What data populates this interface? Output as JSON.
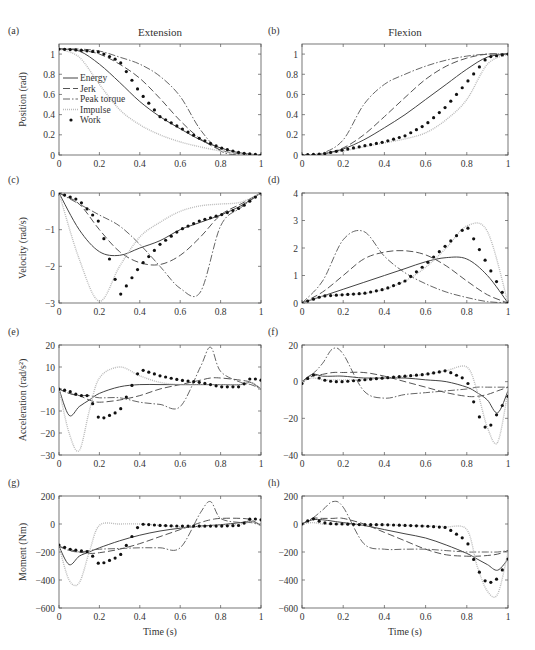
{
  "figure": {
    "column_titles": [
      "Extension",
      "Flexion"
    ],
    "xlabel": "Time (s)",
    "legend": {
      "panel": "a",
      "entries": [
        {
          "name": "Energy",
          "style": "solid"
        },
        {
          "name": "Jerk",
          "style": "dashed"
        },
        {
          "name": "Peak torque",
          "style": "dashdot"
        },
        {
          "name": "Impulse",
          "style": "dotted-light"
        },
        {
          "name": "Work",
          "style": "markers"
        }
      ]
    }
  },
  "chart_data": [
    {
      "panel": "(a)",
      "type": "line",
      "title": "Extension",
      "xlabel": "",
      "ylabel": "Position (rad)",
      "xlim": [
        0,
        1
      ],
      "ylim": [
        0,
        1.1
      ],
      "xticks": [
        "0",
        "0.2",
        "0.4",
        "0.6",
        "0.8",
        "1"
      ],
      "yticks": [
        "0",
        "0.2",
        "0.4",
        "0.6",
        "0.8",
        "1"
      ],
      "x": [
        0,
        0.1,
        0.2,
        0.3,
        0.4,
        0.5,
        0.6,
        0.7,
        0.8,
        0.9,
        1.0
      ],
      "series": [
        {
          "name": "Energy",
          "values": [
            1.05,
            1.03,
            0.9,
            0.72,
            0.53,
            0.38,
            0.26,
            0.15,
            0.07,
            0.02,
            0
          ]
        },
        {
          "name": "Jerk",
          "values": [
            1.05,
            1.04,
            1.0,
            0.9,
            0.76,
            0.56,
            0.34,
            0.16,
            0.05,
            0.01,
            0
          ]
        },
        {
          "name": "Peak torque",
          "values": [
            1.05,
            1.05,
            1.03,
            0.97,
            0.9,
            0.78,
            0.58,
            0.25,
            0.04,
            0.0,
            0
          ]
        },
        {
          "name": "Impulse",
          "values": [
            1.05,
            0.97,
            0.7,
            0.45,
            0.3,
            0.2,
            0.13,
            0.08,
            0.04,
            0.01,
            0
          ]
        },
        {
          "name": "Work",
          "values": [
            1.05,
            1.04,
            1.02,
            0.93,
            0.62,
            0.38,
            0.27,
            0.16,
            0.07,
            0.02,
            0
          ]
        }
      ]
    },
    {
      "panel": "(b)",
      "type": "line",
      "title": "Flexion",
      "xlabel": "",
      "ylabel": "",
      "xlim": [
        0,
        1
      ],
      "ylim": [
        0,
        1.1
      ],
      "xticks": [
        "0",
        "0.2",
        "0.4",
        "0.6",
        "0.8",
        "1"
      ],
      "yticks": [
        "0",
        "0.2",
        "0.4",
        "0.6",
        "0.8",
        "1"
      ],
      "x": [
        0,
        0.1,
        0.2,
        0.3,
        0.4,
        0.5,
        0.6,
        0.7,
        0.8,
        0.9,
        1.0
      ],
      "series": [
        {
          "name": "Energy",
          "values": [
            0,
            0.01,
            0.06,
            0.15,
            0.27,
            0.4,
            0.55,
            0.7,
            0.85,
            0.97,
            1.0
          ]
        },
        {
          "name": "Jerk",
          "values": [
            0,
            0.01,
            0.07,
            0.2,
            0.38,
            0.57,
            0.75,
            0.88,
            0.96,
            1.0,
            1.0
          ]
        },
        {
          "name": "Peak torque",
          "values": [
            0,
            0.02,
            0.15,
            0.5,
            0.7,
            0.8,
            0.88,
            0.94,
            0.98,
            1.0,
            1.0
          ]
        },
        {
          "name": "Impulse",
          "values": [
            0,
            0.01,
            0.04,
            0.08,
            0.12,
            0.16,
            0.22,
            0.35,
            0.55,
            0.9,
            1.0
          ]
        },
        {
          "name": "Work",
          "values": [
            0,
            0.01,
            0.05,
            0.09,
            0.13,
            0.19,
            0.3,
            0.48,
            0.72,
            0.97,
            1.0
          ]
        }
      ]
    },
    {
      "panel": "(c)",
      "type": "line",
      "title": "",
      "xlabel": "",
      "ylabel": "Velocity (rad/s)",
      "xlim": [
        0,
        1
      ],
      "ylim": [
        -3,
        0
      ],
      "xticks": [
        "0",
        "0.2",
        "0.4",
        "0.6",
        "0.8",
        "1"
      ],
      "yticks": [
        "-3",
        "-2",
        "-1",
        "0"
      ],
      "x": [
        0,
        0.1,
        0.2,
        0.3,
        0.4,
        0.5,
        0.6,
        0.7,
        0.8,
        0.9,
        1.0
      ],
      "series": [
        {
          "name": "Energy",
          "values": [
            0,
            -1.0,
            -1.6,
            -1.7,
            -1.5,
            -1.3,
            -1.0,
            -0.8,
            -0.6,
            -0.35,
            0
          ]
        },
        {
          "name": "Jerk",
          "values": [
            0,
            -0.3,
            -1.0,
            -1.6,
            -1.9,
            -1.95,
            -1.7,
            -1.2,
            -0.6,
            -0.3,
            0
          ]
        },
        {
          "name": "Peak torque",
          "values": [
            0,
            -0.3,
            -0.6,
            -0.9,
            -1.4,
            -2.0,
            -2.6,
            -2.7,
            -0.9,
            -0.4,
            0
          ]
        },
        {
          "name": "Impulse",
          "values": [
            0,
            -1.8,
            -2.95,
            -2.0,
            -1.2,
            -0.8,
            -0.5,
            -0.35,
            -0.3,
            -0.25,
            0
          ]
        },
        {
          "name": "Work",
          "values": [
            0,
            -0.2,
            -0.8,
            -2.8,
            -2.0,
            -1.4,
            -1.0,
            -0.75,
            -0.6,
            -0.4,
            0
          ]
        }
      ]
    },
    {
      "panel": "(d)",
      "type": "line",
      "title": "",
      "xlabel": "",
      "ylabel": "",
      "xlim": [
        0,
        1
      ],
      "ylim": [
        0,
        4
      ],
      "xticks": [
        "0",
        "0.2",
        "0.4",
        "0.6",
        "0.8",
        "1"
      ],
      "yticks": [
        "0",
        "1",
        "2",
        "3",
        "4"
      ],
      "x": [
        0,
        0.1,
        0.2,
        0.3,
        0.4,
        0.5,
        0.6,
        0.7,
        0.8,
        0.9,
        1.0
      ],
      "series": [
        {
          "name": "Energy",
          "values": [
            0,
            0.25,
            0.5,
            0.75,
            1.0,
            1.25,
            1.5,
            1.65,
            1.6,
            1.0,
            0
          ]
        },
        {
          "name": "Jerk",
          "values": [
            0,
            0.4,
            1.0,
            1.6,
            1.85,
            1.9,
            1.75,
            1.35,
            0.8,
            0.3,
            0
          ]
        },
        {
          "name": "Peak torque",
          "values": [
            0,
            0.8,
            2.3,
            2.6,
            1.7,
            1.1,
            0.7,
            0.4,
            0.2,
            0.05,
            0
          ]
        },
        {
          "name": "Impulse",
          "values": [
            0,
            0.25,
            0.3,
            0.35,
            0.5,
            0.8,
            1.3,
            2.0,
            2.8,
            2.6,
            0
          ]
        },
        {
          "name": "Work",
          "values": [
            0,
            0.25,
            0.3,
            0.35,
            0.5,
            0.8,
            1.4,
            2.1,
            2.8,
            1.4,
            0
          ]
        }
      ]
    },
    {
      "panel": "(e)",
      "type": "line",
      "title": "",
      "xlabel": "",
      "ylabel": "Acceleration (rad/s²)",
      "xlim": [
        0,
        1
      ],
      "ylim": [
        -30,
        20
      ],
      "xticks": [
        "0",
        "0.2",
        "0.4",
        "0.6",
        "0.8",
        "1"
      ],
      "yticks": [
        "-30",
        "-20",
        "-10",
        "0",
        "10",
        "20"
      ],
      "x": [
        0,
        0.05,
        0.1,
        0.15,
        0.2,
        0.3,
        0.4,
        0.5,
        0.6,
        0.7,
        0.75,
        0.8,
        0.9,
        0.95,
        1.0
      ],
      "series": [
        {
          "name": "Energy",
          "values": [
            0,
            -12,
            -8,
            -5,
            -2,
            1,
            2,
            2,
            2,
            2,
            2,
            2,
            2,
            3,
            0
          ]
        },
        {
          "name": "Jerk",
          "values": [
            0,
            -2,
            -3,
            -5,
            -6,
            -5,
            -3,
            0,
            2,
            4,
            5,
            5,
            4,
            3,
            0
          ]
        },
        {
          "name": "Peak torque",
          "values": [
            0,
            -2,
            -3,
            -3,
            -4,
            -4,
            -6,
            -7,
            -8,
            10,
            19,
            8,
            3,
            2,
            0
          ]
        },
        {
          "name": "Impulse",
          "values": [
            0,
            -20,
            -28,
            -10,
            5,
            10,
            6,
            3,
            2,
            2,
            2,
            2,
            2,
            3,
            0
          ]
        },
        {
          "name": "Work",
          "values": [
            0,
            -1,
            -3,
            -3,
            -14,
            -10,
            9,
            6,
            4,
            3,
            2,
            1,
            1,
            5,
            4
          ]
        }
      ]
    },
    {
      "panel": "(f)",
      "type": "line",
      "title": "",
      "xlabel": "",
      "ylabel": "",
      "xlim": [
        0,
        1
      ],
      "ylim": [
        -40,
        20
      ],
      "xticks": [
        "0",
        "0.2",
        "0.4",
        "0.6",
        "0.8",
        "1"
      ],
      "yticks": [
        "-40",
        "-20",
        "0",
        "20"
      ],
      "x": [
        0,
        0.05,
        0.1,
        0.15,
        0.2,
        0.3,
        0.4,
        0.5,
        0.6,
        0.7,
        0.8,
        0.85,
        0.9,
        0.95,
        1.0
      ],
      "series": [
        {
          "name": "Energy",
          "values": [
            0,
            4,
            3,
            3,
            3,
            2,
            2,
            2,
            1,
            0,
            -3,
            -6,
            -10,
            -17,
            -5
          ]
        },
        {
          "name": "Jerk",
          "values": [
            0,
            3,
            4,
            5,
            5,
            5,
            3,
            0,
            -3,
            -6,
            -8,
            -8,
            -7,
            -5,
            -3
          ]
        },
        {
          "name": "Peak torque",
          "values": [
            0,
            4,
            10,
            18,
            15,
            -5,
            -9,
            -7,
            -6,
            -5,
            -4,
            -3,
            -3,
            -3,
            -3
          ]
        },
        {
          "name": "Impulse",
          "values": [
            0,
            2,
            1,
            1,
            1,
            1,
            2,
            3,
            4,
            6,
            8,
            -5,
            -25,
            -33,
            -5
          ]
        },
        {
          "name": "Work",
          "values": [
            -1,
            4,
            1,
            0,
            0,
            1,
            2,
            3,
            4,
            6,
            1,
            -17,
            -27,
            -17,
            -8
          ]
        }
      ]
    },
    {
      "panel": "(g)",
      "type": "line",
      "title": "",
      "xlabel": "Time (s)",
      "ylabel": "Moment (Nm)",
      "xlim": [
        0,
        1
      ],
      "ylim": [
        -600,
        200
      ],
      "xticks": [
        "0",
        "0.2",
        "0.4",
        "0.6",
        "0.8",
        "1"
      ],
      "yticks": [
        "-600",
        "-400",
        "-200",
        "0",
        "200"
      ],
      "x": [
        0,
        0.05,
        0.1,
        0.15,
        0.2,
        0.3,
        0.4,
        0.5,
        0.6,
        0.7,
        0.75,
        0.8,
        0.9,
        0.95,
        1.0
      ],
      "series": [
        {
          "name": "Energy",
          "values": [
            -160,
            -290,
            -230,
            -200,
            -170,
            -120,
            -80,
            -50,
            -30,
            -15,
            -10,
            -5,
            10,
            20,
            -10
          ]
        },
        {
          "name": "Jerk",
          "values": [
            -160,
            -180,
            -200,
            -210,
            -205,
            -180,
            -140,
            -90,
            -40,
            10,
            30,
            40,
            40,
            30,
            -10
          ]
        },
        {
          "name": "Peak torque",
          "values": [
            -160,
            -190,
            -200,
            -190,
            -180,
            -175,
            -170,
            -170,
            -170,
            80,
            160,
            40,
            10,
            10,
            -10
          ]
        },
        {
          "name": "Impulse",
          "values": [
            -160,
            -400,
            -420,
            -200,
            -10,
            0,
            0,
            -10,
            -20,
            -20,
            -15,
            -10,
            0,
            20,
            -10
          ]
        },
        {
          "name": "Work",
          "values": [
            -150,
            -180,
            -190,
            -200,
            -290,
            -230,
            0,
            -10,
            -15,
            -15,
            -15,
            -15,
            -10,
            40,
            30
          ]
        }
      ]
    },
    {
      "panel": "(h)",
      "type": "line",
      "title": "",
      "xlabel": "Time (s)",
      "ylabel": "",
      "xlim": [
        0,
        1
      ],
      "ylim": [
        -600,
        200
      ],
      "xticks": [
        "0",
        "0.2",
        "0.4",
        "0.6",
        "0.8",
        "1"
      ],
      "yticks": [
        "-600",
        "-400",
        "-200",
        "0",
        "200"
      ],
      "x": [
        0,
        0.05,
        0.1,
        0.15,
        0.2,
        0.3,
        0.4,
        0.5,
        0.6,
        0.7,
        0.8,
        0.85,
        0.9,
        0.95,
        1.0
      ],
      "series": [
        {
          "name": "Energy",
          "values": [
            0,
            30,
            30,
            20,
            10,
            -10,
            -40,
            -70,
            -100,
            -150,
            -210,
            -250,
            -290,
            -330,
            -250
          ]
        },
        {
          "name": "Jerk",
          "values": [
            0,
            40,
            40,
            40,
            40,
            0,
            -60,
            -120,
            -180,
            -220,
            -230,
            -230,
            -225,
            -215,
            -190
          ]
        },
        {
          "name": "Peak torque",
          "values": [
            0,
            40,
            100,
            160,
            120,
            -140,
            -180,
            -180,
            -180,
            -190,
            -200,
            -200,
            -200,
            -200,
            -190
          ]
        },
        {
          "name": "Impulse",
          "values": [
            0,
            10,
            0,
            0,
            0,
            -5,
            -5,
            -10,
            -15,
            -20,
            -40,
            -300,
            -480,
            -500,
            -200
          ]
        },
        {
          "name": "Work",
          "values": [
            0,
            40,
            10,
            0,
            0,
            -5,
            -5,
            -10,
            -15,
            -25,
            -120,
            -320,
            -430,
            -390,
            -250
          ]
        }
      ]
    }
  ]
}
